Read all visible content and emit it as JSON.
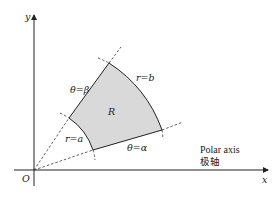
{
  "diagram": {
    "axes": {
      "x_label": "x",
      "y_label": "y",
      "origin_label": "O"
    },
    "region": {
      "label": "R",
      "fill_color": "#d9d9d9",
      "inner_arc_label": "r=a",
      "outer_arc_label": "r=b",
      "lower_ray_label": "θ=α",
      "upper_ray_label": "θ=β"
    },
    "polar_axis": {
      "label_en": "Polar axis",
      "label_cn": "极轴"
    },
    "colors": {
      "line": "#222222",
      "dashed": "#333333",
      "fill": "#d9d9d9"
    }
  }
}
